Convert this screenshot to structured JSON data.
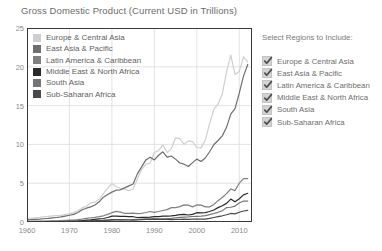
{
  "chart_data": {
    "type": "line",
    "title": "Gross Domestic Product (Current USD in Trillions)",
    "xlabel": "",
    "ylabel": "",
    "xlim": [
      1960,
      2013
    ],
    "ylim": [
      0,
      25
    ],
    "xticks": [
      1960,
      1970,
      1980,
      1990,
      2000,
      2010
    ],
    "yticks": [
      0,
      5,
      10,
      15,
      20,
      25
    ],
    "grid": true,
    "legend_position": "upper-left-inside",
    "x": [
      1960,
      1961,
      1962,
      1963,
      1964,
      1965,
      1966,
      1967,
      1968,
      1969,
      1970,
      1971,
      1972,
      1973,
      1974,
      1975,
      1976,
      1977,
      1978,
      1979,
      1980,
      1981,
      1982,
      1983,
      1984,
      1985,
      1986,
      1987,
      1988,
      1989,
      1990,
      1991,
      1992,
      1993,
      1994,
      1995,
      1996,
      1997,
      1998,
      1999,
      2000,
      2001,
      2002,
      2003,
      2004,
      2005,
      2006,
      2007,
      2008,
      2009,
      2010,
      2011,
      2012
    ],
    "series": [
      {
        "name": "Europe & Central Asia",
        "color": "#cfcfcf",
        "values": [
          0.45,
          0.49,
          0.54,
          0.59,
          0.66,
          0.72,
          0.78,
          0.83,
          0.86,
          0.96,
          1.08,
          1.21,
          1.45,
          1.82,
          2.05,
          2.45,
          2.55,
          2.95,
          3.65,
          4.35,
          4.95,
          4.55,
          4.35,
          4.2,
          4.05,
          4.25,
          5.55,
          6.75,
          7.45,
          7.6,
          8.95,
          9.2,
          9.95,
          8.95,
          9.45,
          10.85,
          10.75,
          10.0,
          10.45,
          10.35,
          9.6,
          9.55,
          10.55,
          12.65,
          14.5,
          15.2,
          16.5,
          19.3,
          21.5,
          19.0,
          19.4,
          21.3,
          20.6
        ]
      },
      {
        "name": "East Asia & Pacific",
        "color": "#6e6e6e",
        "values": [
          0.28,
          0.31,
          0.34,
          0.37,
          0.42,
          0.46,
          0.52,
          0.58,
          0.65,
          0.76,
          0.87,
          0.98,
          1.22,
          1.58,
          1.78,
          1.95,
          2.2,
          2.6,
          3.2,
          3.55,
          3.85,
          4.1,
          4.15,
          4.4,
          4.65,
          4.9,
          6.2,
          7.1,
          8.0,
          8.35,
          8.0,
          8.6,
          9.05,
          8.35,
          8.5,
          8.1,
          7.6,
          7.45,
          7.15,
          7.65,
          8.1,
          7.8,
          8.25,
          9.05,
          9.95,
          10.5,
          11.1,
          12.2,
          13.9,
          14.6,
          16.6,
          18.8,
          20.3
        ]
      },
      {
        "name": "Latin America & Caribbean",
        "color": "#808080",
        "values": [
          0.08,
          0.09,
          0.1,
          0.1,
          0.12,
          0.13,
          0.15,
          0.16,
          0.18,
          0.2,
          0.23,
          0.26,
          0.3,
          0.38,
          0.48,
          0.53,
          0.6,
          0.69,
          0.8,
          0.98,
          1.2,
          1.37,
          1.28,
          1.1,
          1.12,
          1.15,
          1.08,
          1.12,
          1.22,
          1.35,
          1.25,
          1.35,
          1.48,
          1.6,
          1.85,
          1.85,
          1.98,
          2.2,
          2.18,
          1.95,
          2.2,
          2.18,
          1.95,
          1.95,
          2.25,
          2.75,
          3.15,
          3.65,
          4.25,
          4.05,
          5.0,
          5.6,
          5.6
        ]
      },
      {
        "name": "Middle East & North Africa",
        "color": "#2a2a2a",
        "values": [
          0.02,
          0.02,
          0.03,
          0.03,
          0.03,
          0.04,
          0.04,
          0.05,
          0.05,
          0.06,
          0.07,
          0.09,
          0.11,
          0.15,
          0.26,
          0.29,
          0.35,
          0.41,
          0.45,
          0.58,
          0.75,
          0.76,
          0.72,
          0.72,
          0.7,
          0.68,
          0.58,
          0.6,
          0.6,
          0.63,
          0.7,
          0.7,
          0.75,
          0.75,
          0.78,
          0.85,
          0.95,
          0.98,
          0.9,
          0.98,
          1.2,
          1.18,
          1.2,
          1.35,
          1.55,
          1.85,
          2.1,
          2.4,
          2.95,
          2.6,
          3.0,
          3.5,
          3.7
        ]
      },
      {
        "name": "South Asia",
        "color": "#757575",
        "values": [
          0.04,
          0.05,
          0.05,
          0.06,
          0.06,
          0.07,
          0.07,
          0.08,
          0.08,
          0.09,
          0.09,
          0.1,
          0.1,
          0.12,
          0.14,
          0.15,
          0.15,
          0.17,
          0.2,
          0.22,
          0.24,
          0.26,
          0.27,
          0.29,
          0.29,
          0.32,
          0.34,
          0.37,
          0.4,
          0.4,
          0.43,
          0.4,
          0.42,
          0.43,
          0.48,
          0.55,
          0.6,
          0.64,
          0.66,
          0.71,
          0.73,
          0.76,
          0.82,
          0.95,
          1.1,
          1.25,
          1.45,
          1.85,
          1.9,
          2.05,
          2.45,
          2.7,
          2.7
        ]
      },
      {
        "name": "Sub-Saharan Africa",
        "color": "#4a4a4a",
        "values": [
          0.03,
          0.03,
          0.03,
          0.04,
          0.04,
          0.04,
          0.05,
          0.05,
          0.05,
          0.06,
          0.07,
          0.07,
          0.08,
          0.1,
          0.13,
          0.15,
          0.16,
          0.19,
          0.21,
          0.25,
          0.3,
          0.3,
          0.28,
          0.27,
          0.26,
          0.25,
          0.26,
          0.3,
          0.32,
          0.33,
          0.35,
          0.35,
          0.35,
          0.33,
          0.31,
          0.34,
          0.35,
          0.37,
          0.35,
          0.36,
          0.38,
          0.37,
          0.38,
          0.47,
          0.58,
          0.69,
          0.8,
          0.93,
          1.1,
          1.05,
          1.25,
          1.42,
          1.5
        ]
      }
    ]
  },
  "legend": {
    "items": [
      {
        "label": "Europe & Central Asia",
        "color": "#cfcfcf"
      },
      {
        "label": "East Asia & Pacific",
        "color": "#6e6e6e"
      },
      {
        "label": "Latin America & Caribbean",
        "color": "#808080"
      },
      {
        "label": "Middle East & North Africa",
        "color": "#2a2a2a"
      },
      {
        "label": "South Asia",
        "color": "#757575"
      },
      {
        "label": "Sub-Saharan Africa",
        "color": "#4a4a4a"
      }
    ]
  },
  "controls": {
    "title": "Select Regions to Include:",
    "regions": [
      {
        "label": "Europe & Central Asia",
        "checked": true
      },
      {
        "label": "East Asia & Pacific",
        "checked": true
      },
      {
        "label": "Latin America & Caribbean",
        "checked": true
      },
      {
        "label": "Middle East & North Africa",
        "checked": true
      },
      {
        "label": "South Asia",
        "checked": true
      },
      {
        "label": "Sub-Saharan Africa",
        "checked": true
      }
    ]
  },
  "style": {
    "background": "#ffffff",
    "axis_color": "#3a3a3a",
    "grid_color": "#dcdcdc",
    "tick_text_color": "#8a8a8a",
    "title_color": "#6b6b6b"
  }
}
